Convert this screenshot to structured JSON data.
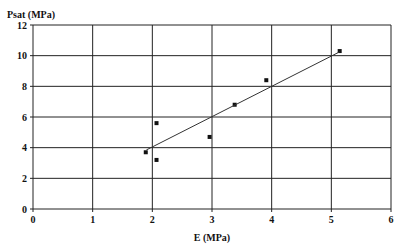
{
  "chart_data": {
    "type": "scatter",
    "title": "",
    "xlabel": "E (MPa)",
    "ylabel": "Psat (MPa)",
    "xlim": [
      0,
      6
    ],
    "ylim": [
      0,
      12
    ],
    "x_ticks": [
      "0",
      "1",
      "2",
      "3",
      "4",
      "5",
      "6"
    ],
    "y_ticks": [
      "0",
      "2",
      "4",
      "6",
      "8",
      "10",
      "12"
    ],
    "grid": true,
    "legend": null,
    "series": [
      {
        "name": "data",
        "marker": "square",
        "points": [
          {
            "x": 1.89,
            "y": 3.7
          },
          {
            "x": 2.07,
            "y": 5.6
          },
          {
            "x": 2.07,
            "y": 3.2
          },
          {
            "x": 2.96,
            "y": 4.7
          },
          {
            "x": 3.38,
            "y": 6.8
          },
          {
            "x": 3.91,
            "y": 8.4
          },
          {
            "x": 5.14,
            "y": 10.3
          }
        ]
      },
      {
        "name": "linear fit",
        "type": "line",
        "points": [
          {
            "x": 1.9,
            "y": 3.85
          },
          {
            "x": 5.14,
            "y": 10.25
          }
        ]
      }
    ]
  }
}
